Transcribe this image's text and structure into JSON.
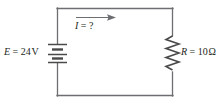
{
  "figure": {
    "name": "dc-circuit-diagram",
    "colors": {
      "wire": "#6d6e71",
      "component": "#4a4a4c",
      "text": "#231f20",
      "background": "#ffffff"
    }
  },
  "source": {
    "symbol": "battery",
    "symbol_name": "battery-symbol",
    "variable": "E",
    "equals": " = ",
    "value": "24",
    "unit": "V",
    "label": "E = 24 V"
  },
  "resistor": {
    "symbol": "zigzag-resistor",
    "symbol_name": "resistor-symbol",
    "variable": "R",
    "equals": " = ",
    "value": "10",
    "unit": "Ω",
    "label": "R = 10 Ω"
  },
  "current": {
    "symbol_name": "current-arrow",
    "variable": "I",
    "equals": " = ",
    "value": "?",
    "label": "I = ?",
    "direction": "clockwise-right"
  }
}
